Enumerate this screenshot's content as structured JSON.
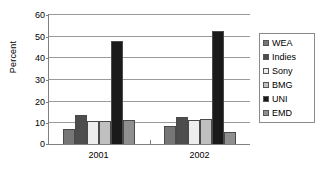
{
  "chart_data": {
    "type": "bar",
    "title": "",
    "xlabel": "",
    "ylabel": "Percent",
    "categories": [
      "2001",
      "2002"
    ],
    "ylim": [
      0,
      60
    ],
    "yticks": [
      0,
      10,
      20,
      30,
      40,
      50,
      60
    ],
    "grid": true,
    "legend_position": "right",
    "series": [
      {
        "name": "WEA",
        "color": "#767676",
        "values": [
          7.0,
          8.3
        ]
      },
      {
        "name": "Indies",
        "color": "#4d4d4d",
        "values": [
          13.5,
          12.5
        ]
      },
      {
        "name": "Sony",
        "color": "#ededed",
        "values": [
          10.8,
          11.2
        ]
      },
      {
        "name": "BMG",
        "color": "#c0c0c0",
        "values": [
          10.4,
          11.7
        ]
      },
      {
        "name": "UNI",
        "color": "#1a1a1a",
        "values": [
          47.5,
          52.0
        ]
      },
      {
        "name": "EMD",
        "color": "#8f8f8f",
        "values": [
          11.0,
          5.5
        ]
      }
    ]
  }
}
